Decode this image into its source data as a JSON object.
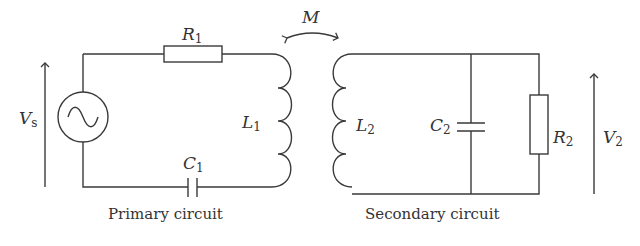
{
  "diagram": {
    "type": "circuit",
    "primary": {
      "caption": "Primary circuit",
      "source": {
        "name": "V",
        "sub": "s",
        "symbol": "AC source"
      },
      "resistor": {
        "name": "R",
        "sub": "1"
      },
      "inductor": {
        "name": "L",
        "sub": "1"
      },
      "capacitor": {
        "name": "C",
        "sub": "1"
      }
    },
    "coupling": {
      "name": "M"
    },
    "secondary": {
      "caption": "Secondary circuit",
      "inductor": {
        "name": "L",
        "sub": "2"
      },
      "capacitor": {
        "name": "C",
        "sub": "2"
      },
      "resistor": {
        "name": "R",
        "sub": "2"
      },
      "output": {
        "name": "V",
        "sub": "2"
      }
    },
    "colors": {
      "line": "#3a3a3a",
      "background": "#ffffff"
    }
  }
}
